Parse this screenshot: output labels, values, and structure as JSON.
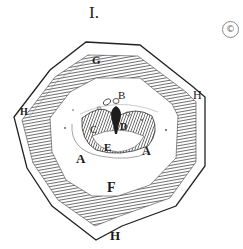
{
  "figure": {
    "number": "I.",
    "corner_mark": "©",
    "labels": {
      "G": "G",
      "H_left": "H",
      "H_right": "H",
      "H_bottom": "H",
      "B": "B",
      "C": "C",
      "D": "D",
      "E": "E",
      "A_left": "A",
      "A_right": "A",
      "F": "F"
    },
    "colors": {
      "ink": "#1a1a1a",
      "hatch": "#3a3a3a",
      "paper": "#ffffff"
    }
  }
}
